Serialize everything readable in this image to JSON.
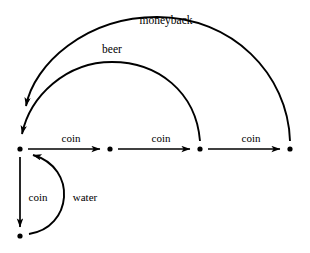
{
  "diagram": {
    "type": "state-transition-graph",
    "title": "",
    "canvas": {
      "width": 310,
      "height": 253,
      "background": "#ffffff"
    },
    "stroke_color": "#000000",
    "nodes": [
      {
        "id": "n1",
        "label": "",
        "x": 20,
        "y": 149,
        "name": "node-1-start"
      },
      {
        "id": "n2",
        "label": "",
        "x": 110,
        "y": 149,
        "name": "node-2"
      },
      {
        "id": "n3",
        "label": "",
        "x": 200,
        "y": 149,
        "name": "node-3"
      },
      {
        "id": "n4",
        "label": "",
        "x": 290,
        "y": 149,
        "name": "node-4"
      },
      {
        "id": "n5",
        "label": "",
        "x": 20,
        "y": 236,
        "name": "node-5-bottom"
      }
    ],
    "edges": [
      {
        "id": "e1",
        "from": "n1",
        "to": "n2",
        "label": "coin",
        "shape": "straight-horizontal",
        "label_x": 71,
        "label_y": 138
      },
      {
        "id": "e2",
        "from": "n2",
        "to": "n3",
        "label": "coin",
        "shape": "straight-horizontal",
        "label_x": 161,
        "label_y": 138
      },
      {
        "id": "e3",
        "from": "n3",
        "to": "n4",
        "label": "coin",
        "shape": "straight-horizontal",
        "label_x": 251,
        "label_y": 138
      },
      {
        "id": "e4",
        "from": "n1",
        "to": "n5",
        "label": "coin",
        "shape": "straight-vertical",
        "label_x": 38,
        "label_y": 197
      },
      {
        "id": "e5",
        "from": "n5",
        "to": "n1",
        "label": "water",
        "shape": "arc-right-bulge",
        "label_x": 85,
        "label_y": 197
      },
      {
        "id": "e6",
        "from": "n3",
        "to": "n1",
        "label": "beer",
        "shape": "arc-over-low",
        "label_x": 112,
        "label_y": 50
      },
      {
        "id": "e7",
        "from": "n4",
        "to": "n1",
        "label": "moneyback",
        "shape": "arc-over-high",
        "label_x": 166,
        "label_y": 21
      }
    ]
  }
}
